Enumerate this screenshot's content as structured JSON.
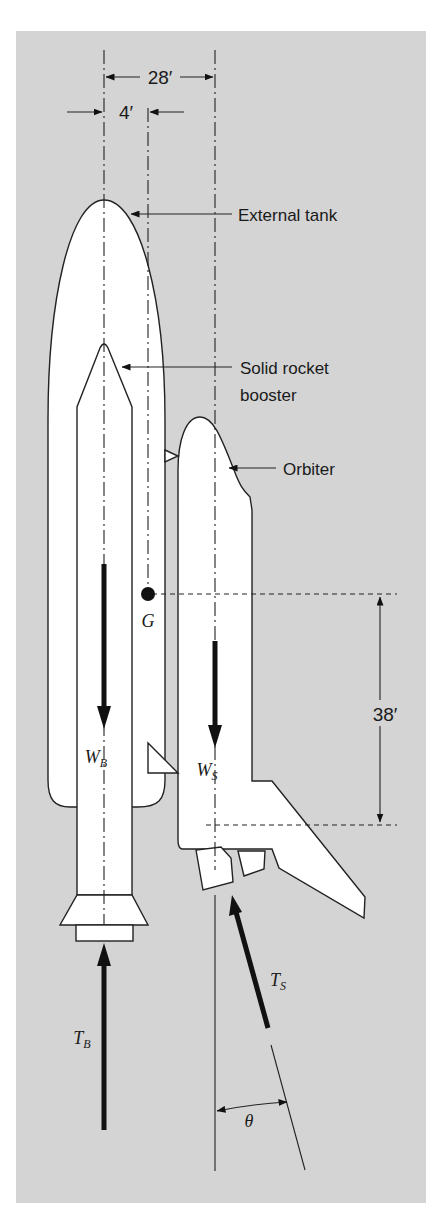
{
  "figure": {
    "background_color": "#ffffff",
    "panel_color": "#d4d4d4",
    "dimensions": {
      "span_total": "28′",
      "offset_g": "4′",
      "vertical_g_to_thrust": "38′"
    },
    "labels": {
      "external_tank": "External tank",
      "srb_line1": "Solid rocket",
      "srb_line2": "booster",
      "orbiter": "Orbiter"
    },
    "symbols": {
      "center_of_gravity": "G",
      "booster_weight": "W",
      "booster_weight_sub": "B",
      "orbiter_weight": "W",
      "orbiter_weight_sub": "S",
      "booster_thrust": "T",
      "booster_thrust_sub": "B",
      "orbiter_thrust": "T",
      "orbiter_thrust_sub": "S",
      "angle": "θ"
    }
  }
}
